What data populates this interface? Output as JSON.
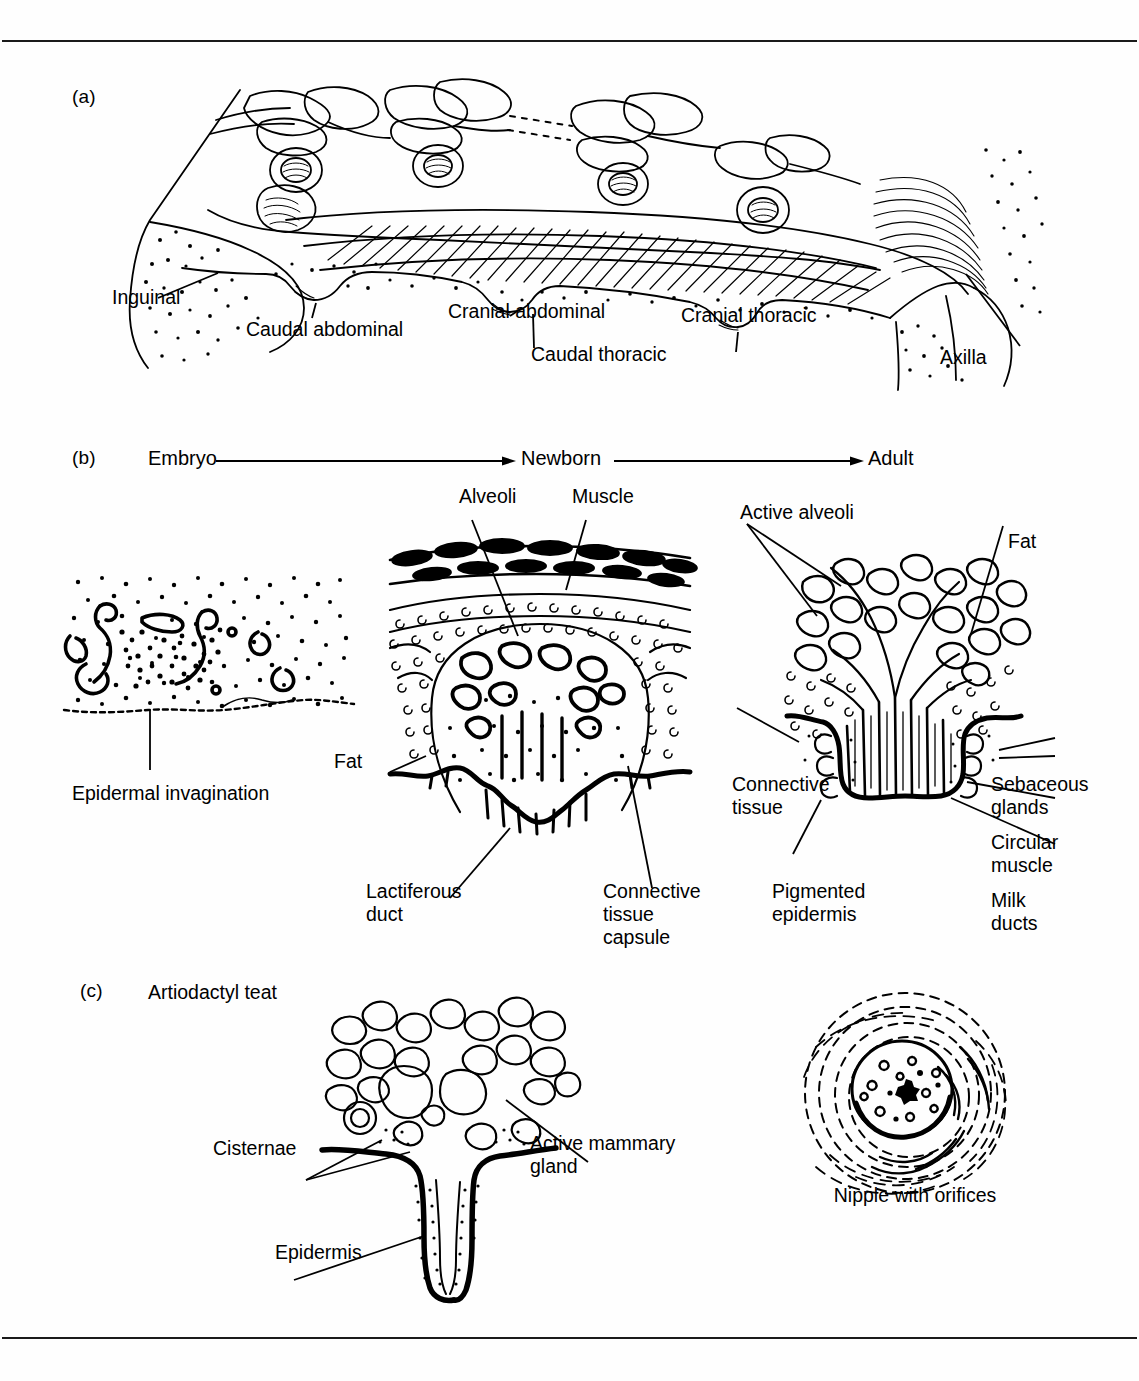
{
  "page": {
    "background": "#fefefe",
    "ink_color": "#000000",
    "rule_top": true,
    "rule_bottom": true
  },
  "panels": {
    "a": {
      "letter": "(a)",
      "labels": [
        {
          "text": "Inguinal",
          "x": 112,
          "y": 295
        },
        {
          "text": "Caudal abdominal",
          "x": 246,
          "y": 327
        },
        {
          "text": "Cranial abdominal",
          "x": 448,
          "y": 309
        },
        {
          "text": "Caudal thoracic",
          "x": 531,
          "y": 352
        },
        {
          "text": "Cranial thoracic",
          "x": 681,
          "y": 313
        },
        {
          "text": "Axilla",
          "x": 940,
          "y": 355
        }
      ]
    },
    "b": {
      "letter": "(b)",
      "stages": [
        "Embryo",
        "Newborn",
        "Adult"
      ],
      "labels_embryo": [
        {
          "text": "Epidermal invagination",
          "x": 72,
          "y": 791
        }
      ],
      "labels_newborn": [
        {
          "text": "Alveoli",
          "x": 459,
          "y": 494
        },
        {
          "text": "Muscle",
          "x": 572,
          "y": 494
        },
        {
          "text": "Fat",
          "x": 334,
          "y": 759
        },
        {
          "text": "Lactiferous\nduct",
          "x": 369,
          "y": 889
        },
        {
          "text": "Connective\ntissue\ncapsule",
          "x": 603,
          "y": 889
        }
      ],
      "labels_adult": [
        {
          "text": "Active alveoli",
          "x": 740,
          "y": 510
        },
        {
          "text": "Fat",
          "x": 1008,
          "y": 539
        },
        {
          "text": "Connective\ntissue",
          "x": 732,
          "y": 782
        },
        {
          "text": "Sebaceous\nglands",
          "x": 991,
          "y": 782
        },
        {
          "text": "Circular\nmuscle",
          "x": 991,
          "y": 840
        },
        {
          "text": "Milk\nducts",
          "x": 991,
          "y": 898
        },
        {
          "text": "Pigmented\nepidermis",
          "x": 772,
          "y": 889
        }
      ]
    },
    "c": {
      "letter": "(c)",
      "title": "Artiodactyl teat",
      "labels": [
        {
          "text": "Cisternae",
          "x": 213,
          "y": 1146
        },
        {
          "text": "Active mammary\ngland",
          "x": 530,
          "y": 1141
        },
        {
          "text": "Epidermis",
          "x": 275,
          "y": 1250
        }
      ],
      "nipple_caption": "Nipple with orifices"
    }
  }
}
